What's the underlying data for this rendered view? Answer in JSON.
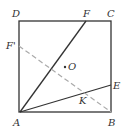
{
  "diagram": {
    "type": "geometry",
    "points": {
      "A": {
        "label": "A",
        "x": 20,
        "y": 112
      },
      "B": {
        "label": "B",
        "x": 111,
        "y": 112
      },
      "C": {
        "label": "C",
        "x": 111,
        "y": 21
      },
      "D": {
        "label": "D",
        "x": 19,
        "y": 21
      },
      "F": {
        "label": "F",
        "x": 86,
        "y": 21
      },
      "F_prime": {
        "label": "F'",
        "x": 19,
        "y": 46
      },
      "E": {
        "label": "E",
        "x": 111,
        "y": 85
      },
      "O": {
        "label": "O",
        "x": 65,
        "y": 67
      },
      "K": {
        "label": "K",
        "x": 83,
        "y": 94
      }
    },
    "segments": [
      {
        "from": "A",
        "to": "B",
        "style": "solid"
      },
      {
        "from": "B",
        "to": "C",
        "style": "solid"
      },
      {
        "from": "C",
        "to": "D",
        "style": "solid"
      },
      {
        "from": "D",
        "to": "A",
        "style": "solid"
      },
      {
        "from": "A",
        "to": "F",
        "style": "solid"
      },
      {
        "from": "A",
        "to": "E",
        "style": "solid"
      },
      {
        "from": "F'",
        "to": "B",
        "style": "dashed"
      }
    ],
    "colors": {
      "line": "#333333",
      "dashed": "#aaaaaa"
    }
  }
}
